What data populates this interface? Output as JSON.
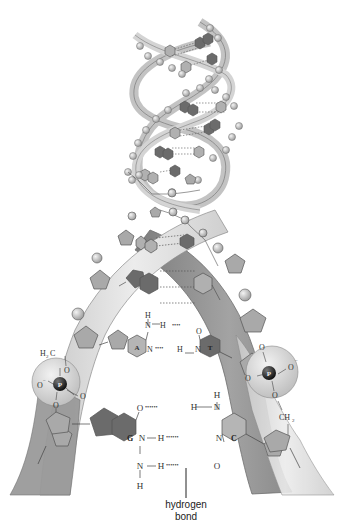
{
  "diagram": {
    "colors": {
      "background": "#ffffff",
      "ribbon_light": "#d9d9d9",
      "ribbon_dark": "#8f8f8f",
      "ribbon_edge": "#6e6e6e",
      "sugar": "#a9a9a9",
      "purine_dark": "#6b6b6b",
      "pyrimidine_light": "#b5b5b5",
      "phosphate_sphere": "#d6d6d6",
      "phosphorus_atom": "#2a2a2a",
      "bond_line": "#444444",
      "text": "#333333"
    },
    "upper_pair": {
      "left_base": "A",
      "right_base": "T",
      "atoms": {
        "h_top": "H",
        "n_top": "N",
        "h_bond_top": "H",
        "o_top": "O",
        "n_left": "N",
        "h_mid": "H",
        "n_right": "N"
      }
    },
    "lower_pair": {
      "left_base": "G",
      "right_base": "C",
      "atoms": {
        "o_top": "O",
        "h_top": "H",
        "n_top": "N",
        "h_cap": "H",
        "n_mid_left": "N",
        "h_mid": "H",
        "n_mid_right": "N",
        "n_bottom": "N",
        "h_bottom": "H",
        "o_bottom": "O",
        "h_nh2": "H"
      }
    },
    "left_phosphate": {
      "atom": "P",
      "ch2": "H",
      "ch2_sub": "2",
      "ch2_c": "C",
      "o_top": "O",
      "o_left": "O",
      "o_left_charge": "−",
      "o_right": "O",
      "o_bottom": "O"
    },
    "right_phosphate": {
      "atom": "P",
      "ch2": "CH",
      "ch2_sub": "2",
      "o_top": "O",
      "o_left": "O",
      "o_right": "O",
      "o_right_charge": "−",
      "o_bottom": "O"
    },
    "callout": {
      "line1": "hydrogen",
      "line2": "bond"
    }
  }
}
